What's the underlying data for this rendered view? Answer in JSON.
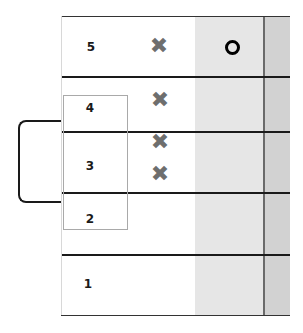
{
  "diagram": {
    "rows": [
      {
        "label": "5",
        "marks": [
          "x"
        ],
        "circle": true
      },
      {
        "label": "4",
        "marks": [
          "x"
        ],
        "circle": false
      },
      {
        "label": "3",
        "marks": [
          "x",
          "x"
        ],
        "circle": false
      },
      {
        "label": "2",
        "marks": [],
        "circle": false
      },
      {
        "label": "1",
        "marks": [],
        "circle": false
      }
    ],
    "x_glyph": "✖",
    "colors": {
      "lines": "#1a1a1a",
      "x_marks": "#6e6e6e",
      "shade_light": "#e6e6e6",
      "shade_dark": "#d2d2d2",
      "box_border": "#a9a9a9"
    },
    "group_box": {
      "covers": [
        "4",
        "3",
        "2"
      ]
    },
    "bracket": {
      "connects": [
        "4",
        "2"
      ]
    }
  }
}
